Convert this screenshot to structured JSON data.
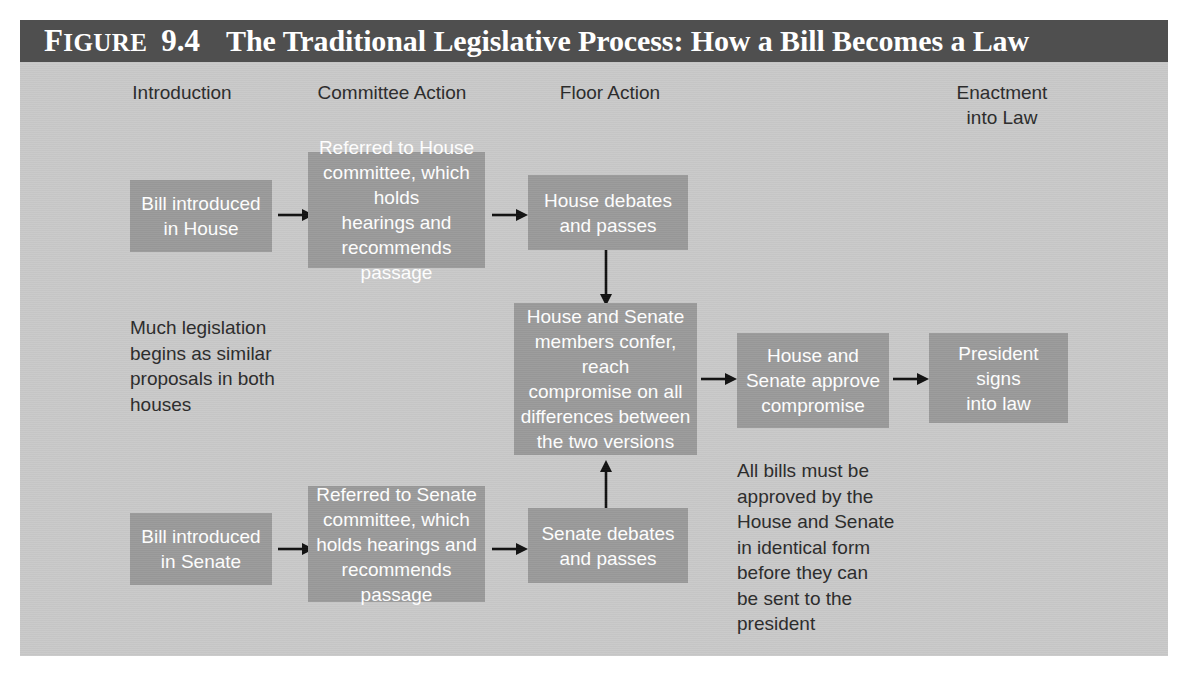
{
  "figure": {
    "label_word": "Figure",
    "label_word_cap": "F",
    "label_word_rest": "IGURE",
    "number": "9.4",
    "title": "The Traditional Legislative Process: How a Bill Becomes a Law"
  },
  "colors": {
    "title_bar_bg": "#4f4f4f",
    "title_text": "#ffffff",
    "panel_bg": "#c9c9c9",
    "box_bg": "#9a9a9a",
    "box_text": "#ffffff",
    "note_text": "#2b2b2b",
    "arrow": "#111111"
  },
  "columns": [
    {
      "id": "introduction",
      "label": "Introduction"
    },
    {
      "id": "committee-action",
      "label": "Committee Action"
    },
    {
      "id": "floor-action",
      "label": "Floor Action"
    },
    {
      "id": "enactment-into-law",
      "label": "Enactment\ninto Law"
    }
  ],
  "boxes": [
    {
      "id": "bill-introduced-house",
      "text": "Bill introduced\nin House"
    },
    {
      "id": "referred-house-committee",
      "text": "Referred to House\ncommittee, which holds\nhearings and\nrecommends passage"
    },
    {
      "id": "house-debates-passes",
      "text": "House debates\nand passes"
    },
    {
      "id": "conference-committee",
      "text": "House and Senate\nmembers confer, reach\ncompromise on all\ndifferences between\nthe two versions"
    },
    {
      "id": "house-senate-approve",
      "text": "House and\nSenate approve\ncompromise"
    },
    {
      "id": "president-signs",
      "text": "President signs\ninto law"
    },
    {
      "id": "bill-introduced-senate",
      "text": "Bill introduced\nin Senate"
    },
    {
      "id": "referred-senate-committee",
      "text": "Referred to Senate\ncommittee, which\nholds hearings and\nrecommends passage"
    },
    {
      "id": "senate-debates-passes",
      "text": "Senate debates\nand passes"
    }
  ],
  "notes": [
    {
      "id": "note-much-legislation",
      "text": "Much legislation\nbegins as similar\nproposals in both\nhouses"
    },
    {
      "id": "note-all-bills",
      "text": "All bills must be\napproved by the\nHouse and Senate\nin identical form\nbefore they can\nbe sent to the\npresident"
    }
  ],
  "arrows": [
    {
      "id": "arrow-house-intro-to-committee",
      "direction": "right"
    },
    {
      "id": "arrow-house-committee-to-floor",
      "direction": "right"
    },
    {
      "id": "arrow-house-floor-to-conference",
      "direction": "down"
    },
    {
      "id": "arrow-conference-to-approve",
      "direction": "right"
    },
    {
      "id": "arrow-approve-to-president",
      "direction": "right"
    },
    {
      "id": "arrow-senate-intro-to-committee",
      "direction": "right"
    },
    {
      "id": "arrow-senate-committee-to-floor",
      "direction": "right"
    },
    {
      "id": "arrow-senate-floor-to-conference",
      "direction": "up"
    }
  ]
}
